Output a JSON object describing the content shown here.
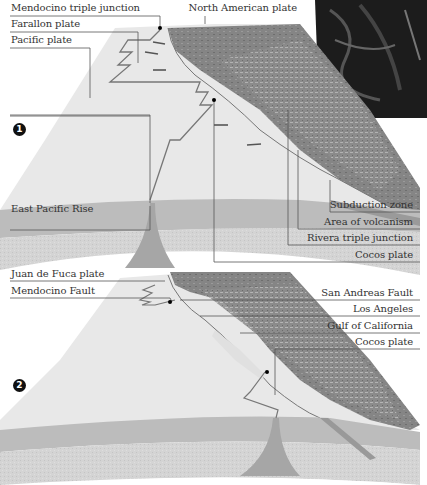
{
  "figure": {
    "panel_1": {
      "number": "1",
      "labels_left": {
        "mendocino_triple_junction": "Mendocino triple junction",
        "farallon_plate": "Farallon plate",
        "pacific_plate": "Pacific plate",
        "east_pacific_rise": "East Pacific Rise"
      },
      "labels_right": {
        "north_american_plate": "North American plate",
        "subduction_zone": "Subduction zone",
        "area_of_volcanism": "Area of volcanism",
        "rivera_triple_junction": "Rivera triple junction",
        "cocos_plate": "Cocos plate"
      }
    },
    "panel_2": {
      "number": "2",
      "labels_left": {
        "juan_de_fuca_plate": "Juan de Fuca plate",
        "mendocino_fault": "Mendocino Fault"
      },
      "labels_right": {
        "san_andreas_fault": "San Andreas Fault",
        "los_angeles": "Los Angeles",
        "gulf_of_california": "Gulf of California",
        "cocos_plate": "Cocos plate"
      }
    },
    "colors": {
      "ocean_surface": "#e6e6e6",
      "crust_band": "#c9c9c9",
      "mantle": "#d6d6d6",
      "land": "#8a8a8a",
      "land_dark": "#6a6a6a",
      "inset_photo": "#1a1a1a",
      "leader_line": "#555555"
    }
  }
}
